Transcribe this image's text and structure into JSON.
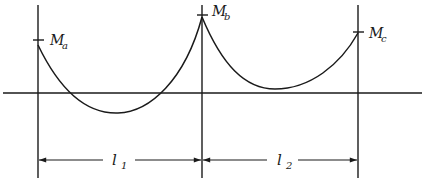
{
  "diagram": {
    "type": "continuous-beam-bending-moment-diagram",
    "colors": {
      "ink": "#1a1a1a",
      "background": "#ffffff"
    },
    "supports": [
      {
        "id": "a",
        "x": 38
      },
      {
        "id": "b",
        "x": 202
      },
      {
        "id": "c",
        "x": 358
      }
    ],
    "moments": [
      {
        "id": "Ma",
        "symbol": "M",
        "subscript": "a",
        "y": 40
      },
      {
        "id": "Mb",
        "symbol": "M",
        "subscript": "b",
        "y": 15
      },
      {
        "id": "Mc",
        "symbol": "M",
        "subscript": "c",
        "y": 32
      }
    ],
    "spans": [
      {
        "id": "l1",
        "symbol": "l",
        "subscript": "1",
        "from": "a",
        "to": "b"
      },
      {
        "id": "l2",
        "symbol": "l",
        "subscript": "2",
        "from": "b",
        "to": "c"
      }
    ],
    "baseline_y": 93,
    "dimension_y": 160
  },
  "labels": {
    "ma_symbol": "M",
    "ma_sub": "a",
    "mb_symbol": "M",
    "mb_sub": "b",
    "mc_symbol": "M",
    "mc_sub": "c",
    "l1_symbol": "l",
    "l1_sub": "1",
    "l2_symbol": "l",
    "l2_sub": "2"
  }
}
